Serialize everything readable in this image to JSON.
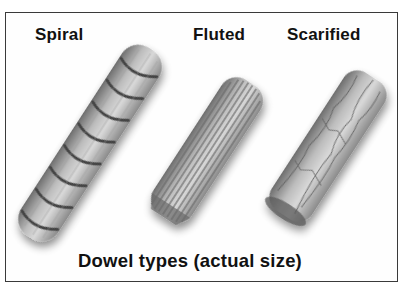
{
  "figure": {
    "caption": "Dowel types (actual size)",
    "dowels": [
      {
        "name": "Spiral",
        "icon": "spiral-dowel-icon"
      },
      {
        "name": "Fluted",
        "icon": "fluted-dowel-icon"
      },
      {
        "name": "Scarified",
        "icon": "scarified-dowel-icon"
      }
    ]
  }
}
